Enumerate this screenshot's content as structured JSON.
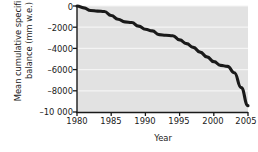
{
  "chart_data": {
    "type": "line",
    "title": "",
    "xlabel": "Year",
    "ylabel": "Mean cumulative specific net balance (mm w.e.)",
    "ylabel_line1": "Mean cumulative specific net",
    "ylabel_line2": "balance (mm w.e.)",
    "xlim": [
      1980,
      2005
    ],
    "ylim": [
      -10000,
      0
    ],
    "xticks": [
      1980,
      1985,
      1990,
      1995,
      2000,
      2005
    ],
    "xtick_labels": [
      "1980",
      "1985",
      "1990",
      "1995",
      "2000",
      "2005"
    ],
    "yticks": [
      0,
      -2000,
      -4000,
      -6000,
      -8000,
      -10000
    ],
    "ytick_labels": [
      "0",
      "–2000",
      "–4000",
      "–6000",
      "–8000",
      "–10 000"
    ],
    "grid": "horizontal-white",
    "legend": "none",
    "plot_background": "#e2e2e2",
    "line_color": "#1a1a1a",
    "line_width": 3.1,
    "x": [
      1980,
      1981,
      1982,
      1983,
      1984,
      1985,
      1986,
      1987,
      1988,
      1989,
      1990,
      1991,
      1992,
      1993,
      1994,
      1995,
      1996,
      1997,
      1998,
      1999,
      2000,
      2001,
      2002,
      2003,
      2004,
      2005
    ],
    "values": [
      0,
      -180,
      -420,
      -480,
      -520,
      -900,
      -1250,
      -1500,
      -1560,
      -1900,
      -2200,
      -2350,
      -2700,
      -2760,
      -2800,
      -3200,
      -3550,
      -3900,
      -4350,
      -4800,
      -5250,
      -5600,
      -5700,
      -6300,
      -7700,
      -8700
    ],
    "final_value": -9400,
    "series": [
      {
        "name": "Mean cumulative specific net balance",
        "values": [
          0,
          -180,
          -420,
          -480,
          -520,
          -900,
          -1250,
          -1500,
          -1560,
          -1900,
          -2200,
          -2350,
          -2700,
          -2760,
          -2800,
          -3200,
          -3550,
          -3900,
          -4350,
          -4800,
          -5250,
          -5600,
          -5700,
          -6300,
          -7700,
          -9400
        ]
      }
    ]
  }
}
